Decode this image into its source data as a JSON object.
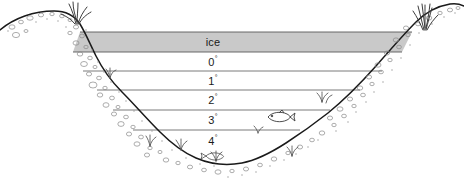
{
  "figure": {
    "width": 464,
    "height": 189,
    "background_color": "#ffffff"
  },
  "ice_layer": {
    "label": "ice",
    "fill_color": "#c9c9c9",
    "stroke_color": "#555555",
    "top_y": 32,
    "bottom_y": 52,
    "left_x": 80,
    "right_x": 412
  },
  "temperature_layers": [
    {
      "label": "0",
      "unit": "°",
      "value": 0,
      "line_y": 52,
      "label_x": 213,
      "label_y": 62,
      "line_left_x": 73,
      "line_right_x": 400
    },
    {
      "label": "1",
      "unit": "°",
      "value": 1,
      "line_y": 71,
      "label_x": 213,
      "label_y": 81,
      "line_left_x": 83,
      "line_right_x": 382
    },
    {
      "label": "2",
      "unit": "°",
      "value": 2,
      "line_y": 90,
      "label_x": 213,
      "label_y": 100,
      "line_left_x": 97,
      "line_right_x": 360
    },
    {
      "label": "3",
      "unit": "°",
      "value": 3,
      "line_y": 110,
      "label_x": 213,
      "label_y": 120,
      "line_left_x": 113,
      "line_right_x": 330
    },
    {
      "label": "4",
      "unit": "°",
      "value": 4,
      "line_y": 130,
      "label_x": 213,
      "label_y": 141,
      "line_left_x": 133,
      "line_right_x": 300
    }
  ],
  "colors": {
    "ice_fill": "#c9c9c9",
    "line_stroke": "#6b6b6b",
    "shore_stroke": "#1a1a1a",
    "sediment_stroke": "#8a8a8a",
    "text": "#1a1a1a",
    "fish_stroke": "#3a3a3a",
    "plant_stroke": "#5a5a5a"
  },
  "annotations": {
    "fish_mid": {
      "name": "fish-swimming-left",
      "x": 278,
      "y": 117
    },
    "plants": [
      {
        "name": "aquatic-plant",
        "x": 150,
        "y": 143
      },
      {
        "name": "aquatic-plant",
        "x": 180,
        "y": 147
      },
      {
        "name": "aquatic-plant",
        "x": 215,
        "y": 158
      },
      {
        "name": "aquatic-plant",
        "x": 292,
        "y": 158
      },
      {
        "name": "aquatic-plant",
        "x": 322,
        "y": 100
      },
      {
        "name": "aquatic-plant",
        "x": 258,
        "y": 131
      },
      {
        "name": "aquatic-plant",
        "x": 108,
        "y": 76
      }
    ],
    "grass_tufts": [
      {
        "name": "shore-grass-left",
        "x": 78,
        "y": 14
      },
      {
        "name": "shore-grass-right",
        "x": 424,
        "y": 16
      }
    ]
  }
}
